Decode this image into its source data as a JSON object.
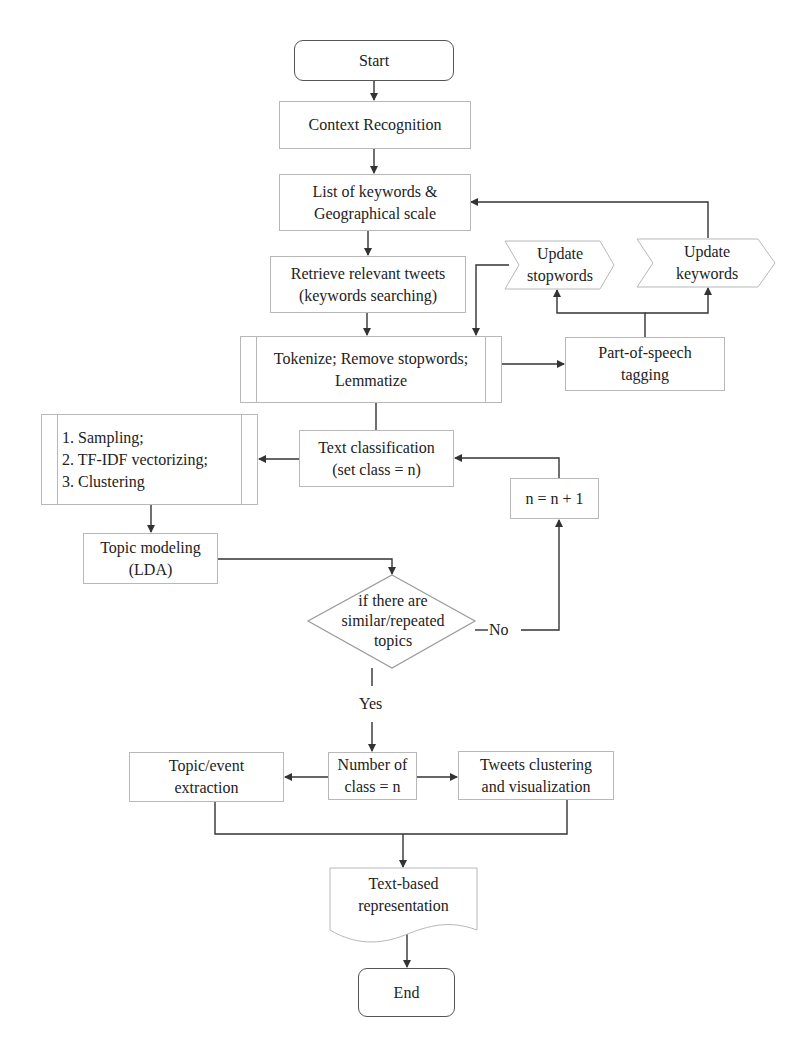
{
  "diagram": {
    "type": "flowchart",
    "nodes": {
      "start": "Start",
      "context": "Context Recognition",
      "keywords": "List of keywords &\nGeographical scale",
      "retrieve": "Retrieve relevant tweets\n(keywords searching)",
      "tokenize": "Tokenize; Remove stopwords;\nLemmatize",
      "pos": "Part-of-speech\ntagging",
      "update_stopwords": "Update\nstopwords",
      "update_keywords": "Update\nkeywords",
      "classification": "Text classification\n(set class = n)",
      "sampling": "1. Sampling;\n2. TF-IDF vectorizing;\n3. Clustering",
      "increment": "n = n + 1",
      "topic_modeling": "Topic modeling\n(LDA)",
      "decision": "if there are\nsimilar/repeated\ntopics",
      "num_class": "Number of\nclass = n",
      "extraction": "Topic/event\nextraction",
      "clustering_vis": "Tweets clustering\nand visualization",
      "representation": "Text-based\nrepresentation",
      "end": "End"
    },
    "edge_labels": {
      "no": "No",
      "yes": "Yes"
    }
  }
}
